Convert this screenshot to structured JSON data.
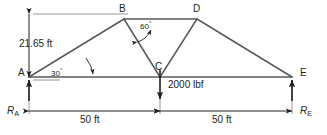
{
  "diagram": {
    "type": "truss-free-body-diagram",
    "colors": {
      "member": "#58595b",
      "annotation": "#231f20",
      "background": "#ffffff"
    },
    "vertices": [
      {
        "id": "A",
        "label": "A",
        "x": 29,
        "y": 77
      },
      {
        "id": "B",
        "label": "B",
        "x": 124,
        "y": 19
      },
      {
        "id": "C",
        "label": "C",
        "x": 160,
        "y": 77
      },
      {
        "id": "D",
        "label": "D",
        "x": 197,
        "y": 19
      },
      {
        "id": "E",
        "label": "E",
        "x": 292,
        "y": 77
      }
    ],
    "members": [
      {
        "from": "A",
        "to": "B"
      },
      {
        "from": "B",
        "to": "D"
      },
      {
        "from": "B",
        "to": "C"
      },
      {
        "from": "C",
        "to": "D"
      },
      {
        "from": "D",
        "to": "E"
      },
      {
        "from": "A",
        "to": "E"
      }
    ],
    "dimensions": {
      "height": {
        "label": "21.65 ft",
        "value": 21.65,
        "unit": "ft"
      },
      "span_left": {
        "label": "50 ft",
        "value": 50,
        "unit": "ft"
      },
      "span_right": {
        "label": "50 ft",
        "value": 50,
        "unit": "ft"
      }
    },
    "angles": {
      "at_A": {
        "label": "30",
        "degree_symbol": "°",
        "value": 30,
        "vertex": "A"
      },
      "at_B": {
        "label": "60",
        "degree_symbol": "°",
        "value": 60,
        "vertex": "B"
      }
    },
    "load": {
      "label": "2000 lbf",
      "magnitude": 2000,
      "unit": "lbf",
      "direction": "down",
      "applied_at": "C"
    },
    "reactions": [
      {
        "id": "RA",
        "symbol": "R",
        "subscript": "A",
        "direction": "up",
        "at": "A"
      },
      {
        "id": "RE",
        "symbol": "R",
        "subscript": "E",
        "direction": "up",
        "at": "E"
      }
    ]
  }
}
